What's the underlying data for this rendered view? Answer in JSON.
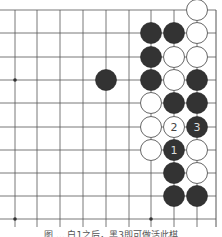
{
  "board": {
    "columns_x": [
      15,
      37,
      60,
      83,
      106,
      129,
      151,
      174,
      197
    ],
    "rows_y": [
      10,
      33,
      57,
      80,
      103,
      127,
      150,
      173,
      196,
      219
    ],
    "right_edge_x": 216,
    "line_color": "#555555",
    "star_points": [
      [
        0,
        3
      ],
      [
        0,
        9
      ],
      [
        6,
        9
      ]
    ],
    "stone_radius": 10.5,
    "colors": {
      "black": "#333333",
      "white": "#ffffff",
      "white_stroke": "#666666",
      "label_on_black": "#dddddd",
      "label_on_white": "#444444"
    },
    "stones": [
      {
        "col": 8,
        "row": 0,
        "color": "white"
      },
      {
        "col": 6,
        "row": 1,
        "color": "black"
      },
      {
        "col": 7,
        "row": 1,
        "color": "black"
      },
      {
        "col": 8,
        "row": 1,
        "color": "white"
      },
      {
        "col": 6,
        "row": 2,
        "color": "black"
      },
      {
        "col": 7,
        "row": 2,
        "color": "white"
      },
      {
        "col": 8,
        "row": 2,
        "color": "white"
      },
      {
        "col": 4,
        "row": 3,
        "color": "black"
      },
      {
        "col": 6,
        "row": 3,
        "color": "black"
      },
      {
        "col": 7,
        "row": 3,
        "color": "white"
      },
      {
        "col": 8,
        "row": 3,
        "color": "black"
      },
      {
        "col": 6,
        "row": 4,
        "color": "white"
      },
      {
        "col": 7,
        "row": 4,
        "color": "black"
      },
      {
        "col": 8,
        "row": 4,
        "color": "black"
      },
      {
        "col": 6,
        "row": 5,
        "color": "white"
      },
      {
        "col": 7,
        "row": 5,
        "color": "white",
        "label": "2"
      },
      {
        "col": 8,
        "row": 5,
        "color": "black",
        "label": "3"
      },
      {
        "col": 6,
        "row": 6,
        "color": "white"
      },
      {
        "col": 7,
        "row": 6,
        "color": "black",
        "label": "1"
      },
      {
        "col": 8,
        "row": 6,
        "color": "white"
      },
      {
        "col": 7,
        "row": 7,
        "color": "black"
      },
      {
        "col": 8,
        "row": 7,
        "color": "white"
      },
      {
        "col": 7,
        "row": 8,
        "color": "black"
      },
      {
        "col": 8,
        "row": 8,
        "color": "black"
      }
    ]
  },
  "caption": "图 ... 白1之后，黑3即可做活此棋"
}
